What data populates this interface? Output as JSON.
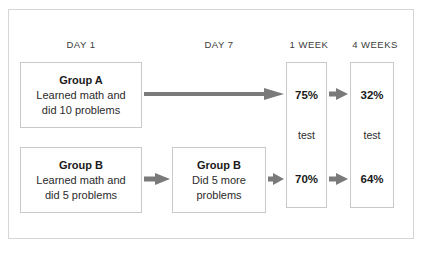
{
  "figure": {
    "title_alt": "Spaced practice study results diagram"
  },
  "columns": [
    {
      "id": "day1",
      "label": "DAY 1"
    },
    {
      "id": "day7",
      "label": "DAY 7"
    },
    {
      "id": "1week",
      "label": "1 WEEK"
    },
    {
      "id": "4weeks",
      "label": "4 WEEKS"
    }
  ],
  "boxes": {
    "group_a": {
      "title": "Group A",
      "line1": "Learned math and",
      "line2": "did 10 problems"
    },
    "group_b": {
      "title": "Group B",
      "line1": "Learned math and",
      "line2": "did 5 problems"
    },
    "group_b_day7": {
      "title": "Group B",
      "line1": "Did 5 more",
      "line2": "problems"
    }
  },
  "results": {
    "week1": {
      "top_score": "75%",
      "test_label": "test",
      "bottom_score": "70%"
    },
    "week4": {
      "top_score": "32%",
      "test_label": "test",
      "bottom_score": "64%"
    }
  },
  "colors": {
    "arrow": "#7a7a7a",
    "box_border": "#c9c9c9",
    "frame_border": "#d6d6d6",
    "text": "#1a1a1a",
    "background": "#ffffff"
  }
}
